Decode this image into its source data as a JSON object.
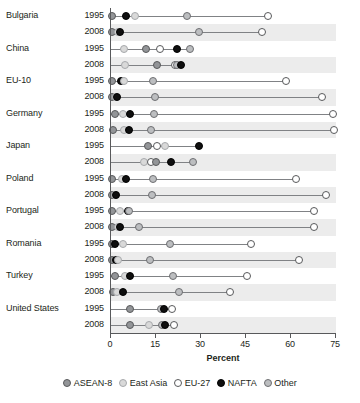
{
  "chart_data": {
    "type": "scatter",
    "title": "",
    "xlabel": "Percent",
    "ylabel": "",
    "xlim": [
      0,
      75
    ],
    "xticks": [
      0,
      15,
      30,
      45,
      60,
      75
    ],
    "xtick_labels": [
      "0",
      "15",
      "30",
      "45",
      "60",
      "75"
    ],
    "grid": false,
    "legend_position": "bottom",
    "series": [
      {
        "name": "ASEAN-8",
        "color": "#939598",
        "marker": "filled-gray"
      },
      {
        "name": "East Asia",
        "color": "#d9d9d9",
        "marker": "filled-light-gray"
      },
      {
        "name": "EU-27",
        "color": "#ffffff",
        "marker": "open-circle"
      },
      {
        "name": "NAFTA",
        "color": "#0f0f0f",
        "marker": "filled-black"
      },
      {
        "name": "Other",
        "color": "#bcbec0",
        "marker": "filled-mid-gray"
      }
    ],
    "categories": [
      "Bulgaria 1995",
      "Bulgaria 2008",
      "China 1995",
      "China 2008",
      "EU-10 1995",
      "EU-10 2008",
      "Germany 1995",
      "Germany 2008",
      "Japan 1995",
      "Japan 2008",
      "Poland 1995",
      "Poland 2008",
      "Portugal 1995",
      "Portugal 2008",
      "Romania 1995",
      "Romania 2008",
      "Turkey 1995",
      "Turkey 2008",
      "United States 1995",
      "United States 2008"
    ],
    "rows": [
      {
        "country": "Bulgaria",
        "year": "1995",
        "banded": false,
        "points": [
          {
            "series": "ASEAN-8",
            "value": 0.6
          },
          {
            "series": "NAFTA",
            "value": 5.2
          },
          {
            "series": "East Asia",
            "value": 8.3
          },
          {
            "series": "Other",
            "value": 25.5
          },
          {
            "series": "EU-27",
            "value": 52.5
          }
        ]
      },
      {
        "country": "",
        "year": "2008",
        "banded": true,
        "points": [
          {
            "series": "ASEAN-8",
            "value": 0.5
          },
          {
            "series": "East Asia",
            "value": 2.6
          },
          {
            "series": "NAFTA",
            "value": 3.4
          },
          {
            "series": "Other",
            "value": 29.5
          },
          {
            "series": "EU-27",
            "value": 50.5
          }
        ]
      },
      {
        "country": "China",
        "year": "1995",
        "banded": false,
        "points": [
          {
            "series": "East Asia",
            "value": 4.8
          },
          {
            "series": "ASEAN-8",
            "value": 12.0
          },
          {
            "series": "EU-27",
            "value": 16.8
          },
          {
            "series": "NAFTA",
            "value": 22.2
          },
          {
            "series": "Other",
            "value": 26.5
          }
        ]
      },
      {
        "country": "",
        "year": "2008",
        "banded": true,
        "points": [
          {
            "series": "East Asia",
            "value": 5.0
          },
          {
            "series": "ASEAN-8",
            "value": 15.5
          },
          {
            "series": "EU-27",
            "value": 21.5
          },
          {
            "series": "Other",
            "value": 22.2
          },
          {
            "series": "NAFTA",
            "value": 23.5
          }
        ]
      },
      {
        "country": "EU-10",
        "year": "1995",
        "banded": false,
        "points": [
          {
            "series": "ASEAN-8",
            "value": 0.8
          },
          {
            "series": "NAFTA",
            "value": 3.8
          },
          {
            "series": "East Asia",
            "value": 4.6
          },
          {
            "series": "Other",
            "value": 14.2
          },
          {
            "series": "EU-27",
            "value": 58.5
          }
        ]
      },
      {
        "country": "",
        "year": "2008",
        "banded": true,
        "points": [
          {
            "series": "ASEAN-8",
            "value": 0.5
          },
          {
            "series": "East Asia",
            "value": 2.0
          },
          {
            "series": "NAFTA",
            "value": 2.4
          },
          {
            "series": "Other",
            "value": 15.0
          },
          {
            "series": "EU-27",
            "value": 70.5
          }
        ]
      },
      {
        "country": "Germany",
        "year": "1995",
        "banded": false,
        "points": [
          {
            "series": "ASEAN-8",
            "value": 1.5
          },
          {
            "series": "East Asia",
            "value": 4.2
          },
          {
            "series": "NAFTA",
            "value": 6.8
          },
          {
            "series": "Other",
            "value": 14.5
          },
          {
            "series": "EU-27",
            "value": 74.2
          }
        ]
      },
      {
        "country": "",
        "year": "2008",
        "banded": true,
        "points": [
          {
            "series": "ASEAN-8",
            "value": 0.9
          },
          {
            "series": "East Asia",
            "value": 4.6
          },
          {
            "series": "NAFTA",
            "value": 6.4
          },
          {
            "series": "Other",
            "value": 13.8
          },
          {
            "series": "EU-27",
            "value": 74.5
          }
        ]
      },
      {
        "country": "Japan",
        "year": "1995",
        "banded": false,
        "points": [
          {
            "series": "ASEAN-8",
            "value": 12.8
          },
          {
            "series": "EU-27",
            "value": 15.8
          },
          {
            "series": "East Asia",
            "value": 18.4
          },
          {
            "series": "NAFTA",
            "value": 29.8
          }
        ]
      },
      {
        "country": "",
        "year": "2008",
        "banded": true,
        "points": [
          {
            "series": "East Asia",
            "value": 11.2
          },
          {
            "series": "EU-27",
            "value": 13.8
          },
          {
            "series": "ASEAN-8",
            "value": 15.2
          },
          {
            "series": "NAFTA",
            "value": 20.2
          },
          {
            "series": "Other",
            "value": 27.8
          }
        ]
      },
      {
        "country": "Poland",
        "year": "1995",
        "banded": false,
        "points": [
          {
            "series": "ASEAN-8",
            "value": 0.8
          },
          {
            "series": "East Asia",
            "value": 4.0
          },
          {
            "series": "NAFTA",
            "value": 5.2
          },
          {
            "series": "Other",
            "value": 14.2
          },
          {
            "series": "EU-27",
            "value": 62.0
          }
        ]
      },
      {
        "country": "",
        "year": "2008",
        "banded": true,
        "points": [
          {
            "series": "ASEAN-8",
            "value": 0.5
          },
          {
            "series": "East Asia",
            "value": 1.6
          },
          {
            "series": "NAFTA",
            "value": 2.0
          },
          {
            "series": "Other",
            "value": 14.0
          },
          {
            "series": "EU-27",
            "value": 72.0
          }
        ]
      },
      {
        "country": "Portugal",
        "year": "1995",
        "banded": false,
        "points": [
          {
            "series": "ASEAN-8",
            "value": 0.5
          },
          {
            "series": "East Asia",
            "value": 3.2
          },
          {
            "series": "NAFTA",
            "value": 6.0
          },
          {
            "series": "Other",
            "value": 6.4
          },
          {
            "series": "EU-27",
            "value": 68.0
          }
        ]
      },
      {
        "country": "",
        "year": "2008",
        "banded": true,
        "points": [
          {
            "series": "ASEAN-8",
            "value": 0.5
          },
          {
            "series": "East Asia",
            "value": 2.6
          },
          {
            "series": "NAFTA",
            "value": 3.4
          },
          {
            "series": "Other",
            "value": 9.8
          },
          {
            "series": "EU-27",
            "value": 68.0
          }
        ]
      },
      {
        "country": "Romania",
        "year": "1995",
        "banded": false,
        "points": [
          {
            "series": "ASEAN-8",
            "value": 0.5
          },
          {
            "series": "NAFTA",
            "value": 1.8
          },
          {
            "series": "East Asia",
            "value": 4.2
          },
          {
            "series": "Other",
            "value": 20.0
          },
          {
            "series": "EU-27",
            "value": 47.0
          }
        ]
      },
      {
        "country": "",
        "year": "2008",
        "banded": true,
        "points": [
          {
            "series": "ASEAN-8",
            "value": 0.5
          },
          {
            "series": "NAFTA",
            "value": 2.0
          },
          {
            "series": "East Asia",
            "value": 2.6
          },
          {
            "series": "Other",
            "value": 13.2
          },
          {
            "series": "EU-27",
            "value": 63.0
          }
        ]
      },
      {
        "country": "Turkey",
        "year": "1995",
        "banded": false,
        "points": [
          {
            "series": "ASEAN-8",
            "value": 1.8
          },
          {
            "series": "East Asia",
            "value": 5.0
          },
          {
            "series": "NAFTA",
            "value": 6.8
          },
          {
            "series": "Other",
            "value": 21.0
          },
          {
            "series": "EU-27",
            "value": 45.5
          }
        ]
      },
      {
        "country": "",
        "year": "2008",
        "banded": true,
        "points": [
          {
            "series": "ASEAN-8",
            "value": 1.0
          },
          {
            "series": "East Asia",
            "value": 2.2
          },
          {
            "series": "NAFTA",
            "value": 4.4
          },
          {
            "series": "Other",
            "value": 23.0
          },
          {
            "series": "EU-27",
            "value": 40.0
          }
        ]
      },
      {
        "country": "United States",
        "year": "1995",
        "banded": false,
        "points": [
          {
            "series": "ASEAN-8",
            "value": 6.8
          },
          {
            "series": "Other",
            "value": 17.0
          },
          {
            "series": "NAFTA",
            "value": 18.0
          },
          {
            "series": "EU-27",
            "value": 20.5
          }
        ]
      },
      {
        "country": "",
        "year": "2008",
        "banded": true,
        "points": [
          {
            "series": "ASEAN-8",
            "value": 6.6
          },
          {
            "series": "East Asia",
            "value": 13.0
          },
          {
            "series": "Other",
            "value": 17.2
          },
          {
            "series": "NAFTA",
            "value": 18.4
          },
          {
            "series": "EU-27",
            "value": 21.2
          }
        ]
      }
    ]
  },
  "legend": {
    "items": [
      {
        "label": "ASEAN-8",
        "key": "ASEAN-8"
      },
      {
        "label": "East Asia",
        "key": "East Asia"
      },
      {
        "label": "EU-27",
        "key": "EU-27"
      },
      {
        "label": "NAFTA",
        "key": "NAFTA"
      },
      {
        "label": "Other",
        "key": "Other"
      }
    ]
  }
}
